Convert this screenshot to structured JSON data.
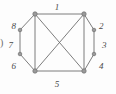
{
  "figure": {
    "type": "graph-diagram",
    "background_color": "#fdfdfd",
    "stroke_color": "#6e6e6e",
    "node_fill_color": "#9a9a9a",
    "label_color": "#4a4a4a",
    "width": 116,
    "height": 94
  },
  "stray_text": {
    "left_paren": ")"
  },
  "nodes": [
    {
      "id": "top-left",
      "name": "corner-node-top-left",
      "x": 35,
      "y": 14,
      "r": 2.2
    },
    {
      "id": "top-right",
      "name": "corner-node-top-right",
      "x": 84,
      "y": 14,
      "r": 2.2
    },
    {
      "id": "bottom-right",
      "name": "corner-node-bottom-right",
      "x": 84,
      "y": 71,
      "r": 2.2
    },
    {
      "id": "bottom-left",
      "name": "corner-node-bottom-left",
      "x": 35,
      "y": 71,
      "r": 2.2
    },
    {
      "id": "left-upper",
      "name": "side-node-left-upper",
      "x": 20,
      "y": 30,
      "r": 1.8
    },
    {
      "id": "left-lower",
      "name": "side-node-left-lower",
      "x": 20,
      "y": 54,
      "r": 1.8
    },
    {
      "id": "right-upper",
      "name": "side-node-right-upper",
      "x": 94,
      "y": 30,
      "r": 1.8
    },
    {
      "id": "right-lower",
      "name": "side-node-right-lower",
      "x": 94,
      "y": 54,
      "r": 1.8
    }
  ],
  "edges": [
    {
      "name": "edge-top",
      "from": "top-left",
      "to": "top-right"
    },
    {
      "name": "edge-bottom",
      "from": "bottom-left",
      "to": "bottom-right"
    },
    {
      "name": "edge-left-vertical",
      "from": "top-left",
      "to": "bottom-left"
    },
    {
      "name": "edge-right-vertical",
      "from": "top-right",
      "to": "bottom-right"
    },
    {
      "name": "edge-diagonal-a",
      "from": "top-left",
      "to": "bottom-right"
    },
    {
      "name": "edge-diagonal-b",
      "from": "top-right",
      "to": "bottom-left"
    },
    {
      "name": "edge-left-upper-arc",
      "from": "top-left",
      "to": "left-upper"
    },
    {
      "name": "edge-left-mid-arc",
      "from": "left-upper",
      "to": "left-lower"
    },
    {
      "name": "edge-left-lower-arc",
      "from": "left-lower",
      "to": "bottom-left"
    },
    {
      "name": "edge-right-upper-arc",
      "from": "top-right",
      "to": "right-upper"
    },
    {
      "name": "edge-right-mid-arc",
      "from": "right-upper",
      "to": "right-lower"
    },
    {
      "name": "edge-right-lower-arc",
      "from": "right-lower",
      "to": "bottom-right"
    }
  ],
  "labels": [
    {
      "name": "edge-label-1",
      "text": "1",
      "x": 57,
      "y": 3,
      "align": "center"
    },
    {
      "name": "edge-label-2",
      "text": "2",
      "x": 99,
      "y": 22,
      "align": "left"
    },
    {
      "name": "edge-label-3",
      "text": "3",
      "x": 102,
      "y": 41,
      "align": "left"
    },
    {
      "name": "edge-label-4",
      "text": "4",
      "x": 99,
      "y": 62,
      "align": "left"
    },
    {
      "name": "edge-label-5",
      "text": "5",
      "x": 57,
      "y": 80,
      "align": "center"
    },
    {
      "name": "edge-label-6",
      "text": "6",
      "x": 16,
      "y": 62,
      "align": "right"
    },
    {
      "name": "edge-label-7",
      "text": "7",
      "x": 13,
      "y": 41,
      "align": "right"
    },
    {
      "name": "edge-label-8",
      "text": "8",
      "x": 16,
      "y": 22,
      "align": "right"
    }
  ]
}
